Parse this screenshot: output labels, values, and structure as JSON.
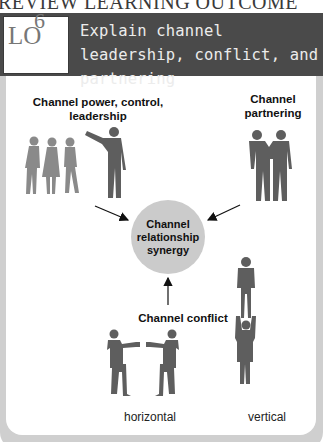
{
  "page": {
    "top_title": "REVIEW LEARNING OUTCOME"
  },
  "header": {
    "lo_prefix": "LO",
    "lo_number": "6",
    "title": "Explain channel leadership, conflict, and partnering"
  },
  "diagram": {
    "top_left_label": "Channel power, control, leadership",
    "top_right_label": "Channel partnering",
    "center_label": "Channel relationship synergy",
    "conflict_label": "Channel conflict",
    "conflict_types": {
      "horizontal": "horizontal",
      "vertical": "vertical"
    },
    "icons": {
      "leadership": "leader-with-followers-icon",
      "partnering": "two-people-arm-in-arm-icon",
      "horizontal_conflict": "boxers-facing-icon",
      "vertical_conflict": "acrobats-stacked-icon"
    },
    "colors": {
      "figure": "#5e5e5e",
      "figure_light": "#8a8a8a",
      "circle": "#cbcbcb",
      "header_bar": "#4a4a4a",
      "frame": "#cfcfcf"
    }
  }
}
